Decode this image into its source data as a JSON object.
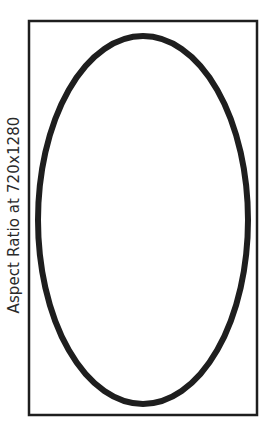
{
  "diagram": {
    "label": "Aspect Ratio at 720x1280",
    "frame": {
      "shape": "rectangle",
      "stroke_color": "#1e1e1e",
      "stroke_width": 2.5,
      "x": 29,
      "y": 21,
      "width": 228,
      "height": 394
    },
    "shape": {
      "type": "ellipse",
      "stroke_color": "#1e1e1e",
      "stroke_width": 6,
      "cx": 143,
      "cy": 220,
      "rx": 105,
      "ry": 184
    },
    "background": "#ffffff"
  }
}
